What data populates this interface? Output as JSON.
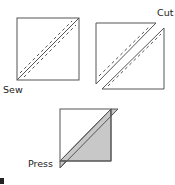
{
  "diagram": {
    "steps": [
      {
        "id": "sew",
        "label": "Sew",
        "description": "Two squares layered, stitched 1/4 inch on each side of the diagonal"
      },
      {
        "id": "cut",
        "label": "Cut",
        "description": "Cut along diagonal, yielding two stitched triangle pairs"
      },
      {
        "id": "press",
        "label": "Press",
        "description": "Open and press seam toward shaded triangle"
      }
    ],
    "colors": {
      "outline": "#555555",
      "shade": "#c8c8c8",
      "background": "#ffffff"
    }
  }
}
